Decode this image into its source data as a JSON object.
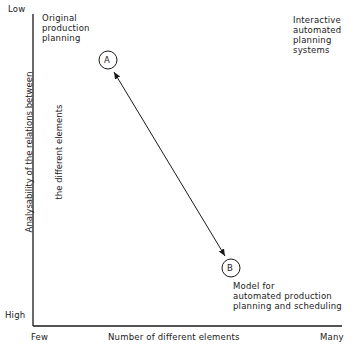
{
  "diagram": {
    "y_axis": {
      "title_line1": "Analysability of the relations between",
      "title_line2": "the different elements",
      "top_label": "Low",
      "bottom_label": "High"
    },
    "x_axis": {
      "title": "Number of different elements",
      "left_label": "Few",
      "right_label": "Many"
    },
    "annotations": {
      "top_left": "Original\nproduction\nplanning",
      "top_right": "Interactive\nautomated\nplanning\nsystems",
      "bottom_right": "Model for\nautomated production\nplanning and scheduling"
    },
    "points": [
      {
        "id": "A",
        "label": "A"
      },
      {
        "id": "B",
        "label": "B"
      }
    ],
    "connector": "double-headed arrow between A and B",
    "colors": {
      "ink": "#1a1a1a",
      "background": "#ffffff"
    }
  }
}
